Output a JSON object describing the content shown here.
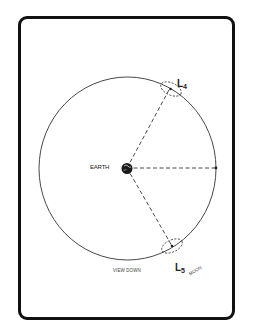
{
  "diagram": {
    "center_label": "EARTH",
    "points": [
      {
        "id": "L4",
        "label": "L",
        "subscript": "4"
      },
      {
        "id": "L5",
        "label": "L",
        "subscript": "5"
      }
    ],
    "caption_view": "VIEW DOWN",
    "caption_moon": "MOON",
    "colors": {
      "line": "#222222",
      "frame": "#111111",
      "background": "#ffffff"
    }
  }
}
